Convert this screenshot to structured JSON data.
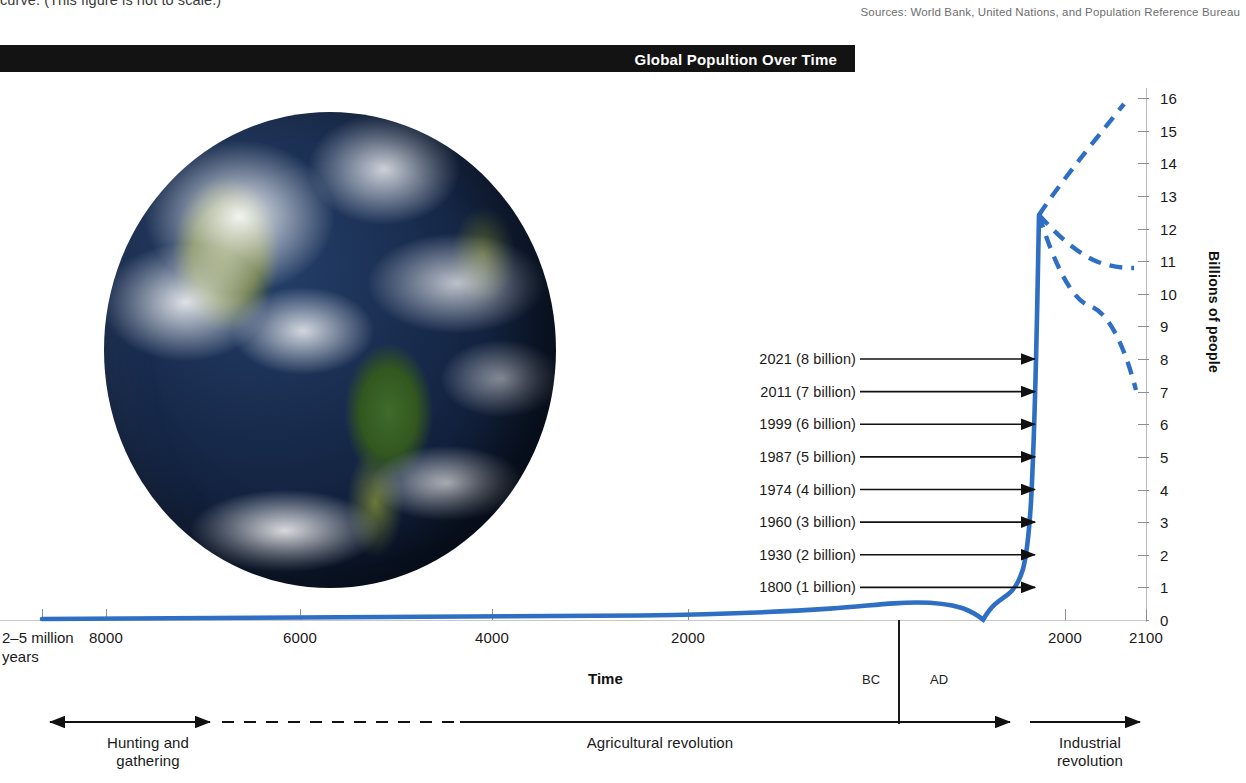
{
  "caption": {
    "top_text": "curve. (This figure is not to scale.)"
  },
  "sources": {
    "text": "Sources: World Bank, United Nations, and Population Reference Bureau"
  },
  "title_bar": {
    "title": "Global Popultion Over Time"
  },
  "figure": {
    "earth_alt": "photograph of planet Earth showing the Americas"
  },
  "axes": {
    "y_title": "Billions of people",
    "x_title": "Time",
    "bc_label": "BC",
    "ad_label": "AD",
    "x_left_label_line1": "2–5 million",
    "x_left_label_line2": "years"
  },
  "eras": [
    {
      "name": "hunting-and-gathering",
      "label_line1": "Hunting and",
      "label_line2": "gathering"
    },
    {
      "name": "agricultural-revolution",
      "label_line1": "Agricultural revolution",
      "label_line2": ""
    },
    {
      "name": "industrial-revolution",
      "label_line1": "Industrial",
      "label_line2": "revolution"
    }
  ],
  "annotations": [
    {
      "year": 1800,
      "billions": 1,
      "label": "1800 (1 billion)"
    },
    {
      "year": 1930,
      "billions": 2,
      "label": "1930 (2 billion)"
    },
    {
      "year": 1960,
      "billions": 3,
      "label": "1960 (3 billion)"
    },
    {
      "year": 1974,
      "billions": 4,
      "label": "1974 (4 billion)"
    },
    {
      "year": 1987,
      "billions": 5,
      "label": "1987 (5 billion)"
    },
    {
      "year": 1999,
      "billions": 6,
      "label": "1999 (6 billion)"
    },
    {
      "year": 2011,
      "billions": 7,
      "label": "2011 (7 billion)"
    },
    {
      "year": 2021,
      "billions": 8,
      "label": "2021 (8 billion)"
    }
  ],
  "chart_data": {
    "type": "line",
    "title": "Global Popultion Over Time",
    "xlabel": "Time",
    "ylabel": "Billions of people",
    "ylim": [
      0,
      16
    ],
    "grid": false,
    "legend": "none",
    "not_to_scale": true,
    "y_ticks": [
      0,
      1,
      2,
      3,
      4,
      5,
      6,
      7,
      8,
      9,
      10,
      11,
      12,
      13,
      14,
      15,
      16
    ],
    "x_tick_labels": [
      "2–5 million years",
      "8000",
      "6000",
      "4000",
      "2000",
      "BC",
      "AD",
      "2000",
      "2100"
    ],
    "x_axis_note": "Non-linear (compressed) time axis: 2–5 million years ago through 2100 AD",
    "series": [
      {
        "name": "Historical population",
        "style": "solid",
        "color": "#2e6fc4",
        "points": [
          {
            "x": "2-5 million years ago",
            "y": 0.0
          },
          {
            "x": "8000 BC",
            "y": 0.005
          },
          {
            "x": "6000 BC",
            "y": 0.01
          },
          {
            "x": "4000 BC",
            "y": 0.02
          },
          {
            "x": "2000 BC",
            "y": 0.05
          },
          {
            "x": "1 AD",
            "y": 0.2
          },
          {
            "x": "1000 AD",
            "y": 0.3
          },
          {
            "x": "1340 AD",
            "y": 0.44
          },
          {
            "x": "1400 AD (plague trough)",
            "y": 0.0
          },
          {
            "x": "1500 AD",
            "y": 0.46
          },
          {
            "x": "1800 AD",
            "y": 1.0
          },
          {
            "x": "1930 AD",
            "y": 2.0
          },
          {
            "x": "1960 AD",
            "y": 3.0
          },
          {
            "x": "1974 AD",
            "y": 4.0
          },
          {
            "x": "1987 AD",
            "y": 5.0
          },
          {
            "x": "1999 AD",
            "y": 6.0
          },
          {
            "x": "2011 AD",
            "y": 7.0
          },
          {
            "x": "2021 AD",
            "y": 8.0
          }
        ]
      },
      {
        "name": "High projection",
        "style": "dashed",
        "color": "#2e6fc4",
        "points": [
          {
            "x": "2021 AD",
            "y": 8.0
          },
          {
            "x": "2050 AD",
            "y": 11.0
          },
          {
            "x": "2100 AD",
            "y": 15.8
          }
        ]
      },
      {
        "name": "Medium projection",
        "style": "dashed",
        "color": "#2e6fc4",
        "points": [
          {
            "x": "2021 AD",
            "y": 8.0
          },
          {
            "x": "2060 AD",
            "y": 10.3
          },
          {
            "x": "2100 AD",
            "y": 11.0
          }
        ]
      },
      {
        "name": "Low projection",
        "style": "dashed",
        "color": "#2e6fc4",
        "points": [
          {
            "x": "2021 AD",
            "y": 8.0
          },
          {
            "x": "2055 AD",
            "y": 9.0
          },
          {
            "x": "2100 AD",
            "y": 7.35
          }
        ]
      }
    ]
  },
  "colors": {
    "curve": "#2e6fc4",
    "title_bar_bg": "#131313",
    "title_bar_text": "#ffffff",
    "axis": "#8e8e8e",
    "text": "#1a1a1a",
    "sources_text": "#6e6e6e"
  }
}
